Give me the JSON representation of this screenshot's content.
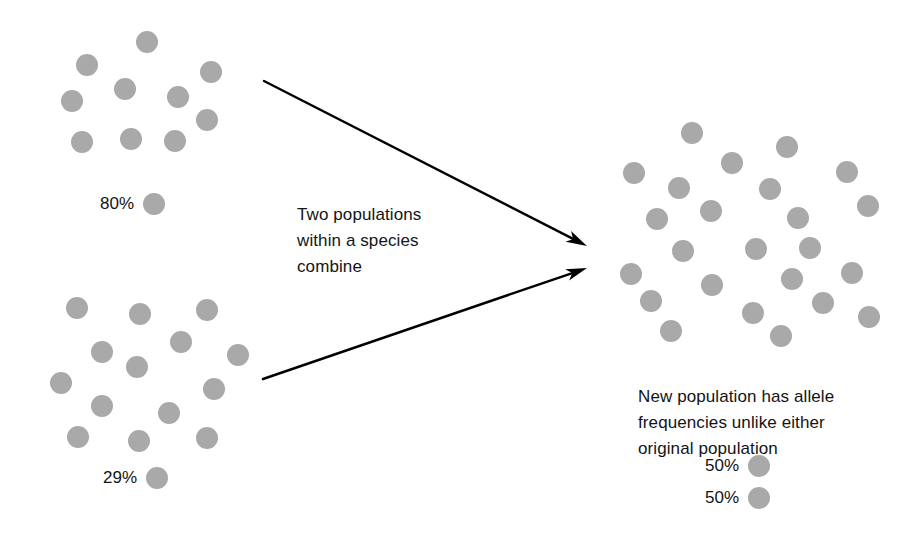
{
  "figure": {
    "background_color": "#ffffff",
    "dot_color": "#a9a9a9",
    "text_color": "#141414",
    "arrow_color": "#000000",
    "dot_diameter": 22
  },
  "populations": {
    "top_left": {
      "name": "Population 1",
      "allele_frequency_label": "80%",
      "dot_count": 10,
      "dots": [
        {
          "x": 136,
          "y": 31
        },
        {
          "x": 76,
          "y": 54
        },
        {
          "x": 200,
          "y": 61
        },
        {
          "x": 114,
          "y": 78
        },
        {
          "x": 167,
          "y": 86
        },
        {
          "x": 61,
          "y": 90
        },
        {
          "x": 196,
          "y": 109
        },
        {
          "x": 71,
          "y": 131
        },
        {
          "x": 120,
          "y": 128
        },
        {
          "x": 164,
          "y": 130
        }
      ]
    },
    "bottom_left": {
      "name": "Population 2",
      "allele_frequency_label": "29%",
      "dot_count": 14,
      "dots": [
        {
          "x": 66,
          "y": 297
        },
        {
          "x": 129,
          "y": 303
        },
        {
          "x": 196,
          "y": 299
        },
        {
          "x": 170,
          "y": 331
        },
        {
          "x": 91,
          "y": 341
        },
        {
          "x": 227,
          "y": 344
        },
        {
          "x": 126,
          "y": 356
        },
        {
          "x": 50,
          "y": 372
        },
        {
          "x": 203,
          "y": 378
        },
        {
          "x": 91,
          "y": 395
        },
        {
          "x": 158,
          "y": 402
        },
        {
          "x": 67,
          "y": 426
        },
        {
          "x": 128,
          "y": 430
        },
        {
          "x": 196,
          "y": 427
        }
      ]
    },
    "merged_right": {
      "name": "New population",
      "dot_count": 24,
      "dots": [
        {
          "x": 681,
          "y": 122
        },
        {
          "x": 776,
          "y": 136
        },
        {
          "x": 623,
          "y": 162
        },
        {
          "x": 721,
          "y": 152
        },
        {
          "x": 836,
          "y": 161
        },
        {
          "x": 668,
          "y": 177
        },
        {
          "x": 759,
          "y": 178
        },
        {
          "x": 787,
          "y": 207
        },
        {
          "x": 646,
          "y": 208
        },
        {
          "x": 700,
          "y": 200
        },
        {
          "x": 857,
          "y": 195
        },
        {
          "x": 799,
          "y": 237
        },
        {
          "x": 620,
          "y": 263
        },
        {
          "x": 672,
          "y": 240
        },
        {
          "x": 745,
          "y": 238
        },
        {
          "x": 841,
          "y": 262
        },
        {
          "x": 701,
          "y": 274
        },
        {
          "x": 640,
          "y": 290
        },
        {
          "x": 781,
          "y": 268
        },
        {
          "x": 812,
          "y": 292
        },
        {
          "x": 742,
          "y": 302
        },
        {
          "x": 858,
          "y": 306
        },
        {
          "x": 660,
          "y": 320
        },
        {
          "x": 770,
          "y": 325
        }
      ]
    }
  },
  "legends": {
    "top_left_frequency": {
      "label": "80%",
      "x": 100,
      "y": 193
    },
    "bottom_left_frequency": {
      "label": "29%",
      "x": 103,
      "y": 467
    },
    "merged_frequency_a": {
      "label": "50%",
      "x": 705,
      "y": 455
    },
    "merged_frequency_b": {
      "label": "50%",
      "x": 705,
      "y": 487
    }
  },
  "captions": {
    "combine": {
      "lines": [
        "Two populations",
        "within a species",
        "combine"
      ],
      "text": "Two populations within a species combine",
      "x": 297,
      "y": 202
    },
    "result": {
      "lines": [
        "New population has allele",
        "frequencies unlike either",
        "original population"
      ],
      "text": "New population has allele frequencies unlike either original population",
      "x": 638,
      "y": 384
    }
  },
  "arrows": [
    {
      "name": "arrow-top-to-merged",
      "from": {
        "x": 264,
        "y": 81
      },
      "to": {
        "x": 587,
        "y": 246
      }
    },
    {
      "name": "arrow-bottom-to-merged",
      "from": {
        "x": 263,
        "y": 379
      },
      "to": {
        "x": 587,
        "y": 268
      }
    }
  ]
}
